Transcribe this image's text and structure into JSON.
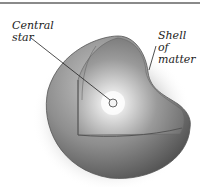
{
  "diagram": {
    "title": "",
    "labels": {
      "central_star_line1": "Central",
      "central_star_line2": "star",
      "shell_line1": "Shell of",
      "shell_line2": "matter"
    },
    "elements": [
      {
        "name": "sphere-shell",
        "description": "Spherical shell with octant cutaway"
      },
      {
        "name": "central-star",
        "description": "Small bright star at center"
      }
    ],
    "colors": {
      "shell_dark": "#4a4a4a",
      "shell_mid": "#8c8c8c",
      "shell_light": "#cfcfcf",
      "glow": "#ffffff",
      "rule": "#8a8a8a"
    }
  }
}
